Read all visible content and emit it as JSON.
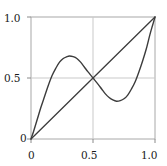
{
  "chart_data": {
    "type": "line",
    "title": "",
    "xlabel": "",
    "ylabel": "",
    "xlim": [
      0,
      1
    ],
    "ylim": [
      0,
      1
    ],
    "grid": true,
    "legend_position": "none",
    "xticks": [
      0,
      0.5,
      1
    ],
    "yticks": [
      0,
      0.5,
      1
    ],
    "xtick_labels": [
      "0",
      "0.5",
      "1.0"
    ],
    "ytick_labels": [
      "0",
      "0.5",
      "1.0"
    ],
    "series": [
      {
        "name": "cubic-map-curve",
        "color": "#3c3c3c",
        "x": [
          0.0,
          0.02,
          0.05,
          0.08,
          0.11,
          0.14,
          0.17,
          0.2,
          0.23,
          0.26,
          0.29,
          0.31,
          0.34,
          0.37,
          0.4,
          0.43,
          0.46,
          0.5,
          0.54,
          0.57,
          0.6,
          0.63,
          0.66,
          0.69,
          0.72,
          0.75,
          0.78,
          0.81,
          0.84,
          0.87,
          0.9,
          0.93,
          0.96,
          0.98,
          1.0
        ],
        "y": [
          0.0,
          0.06,
          0.16,
          0.26,
          0.35,
          0.44,
          0.52,
          0.58,
          0.63,
          0.66,
          0.675,
          0.68,
          0.675,
          0.66,
          0.63,
          0.59,
          0.55,
          0.5,
          0.45,
          0.41,
          0.37,
          0.34,
          0.32,
          0.31,
          0.315,
          0.33,
          0.36,
          0.41,
          0.47,
          0.55,
          0.64,
          0.74,
          0.86,
          0.93,
          1.0
        ]
      },
      {
        "name": "identity-diagonal",
        "color": "#3c3c3c",
        "x": [
          0,
          1
        ],
        "y": [
          0,
          1
        ]
      }
    ],
    "annotations": []
  },
  "axes": {
    "frame_color": "#aaaaaa",
    "grid_color": "#c8c8c8",
    "tick_color": "#888888",
    "y_tick_labels": {
      "top": "1.0",
      "mid": "0.5",
      "bottom": "0"
    },
    "x_tick_labels": {
      "left": "0",
      "mid": "0.5",
      "right": "1.0"
    }
  }
}
